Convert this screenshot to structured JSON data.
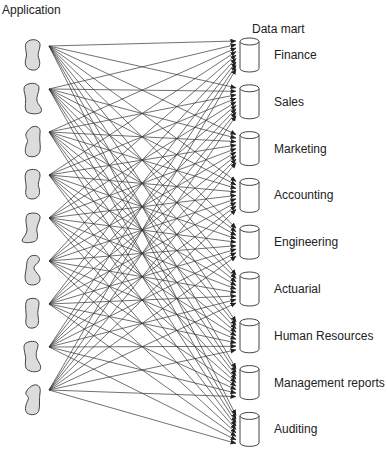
{
  "headings": {
    "applications": "Application",
    "data_marts": "Data mart"
  },
  "applications": [
    {
      "name": "Application 1"
    },
    {
      "name": "Application 2"
    },
    {
      "name": "Application 3"
    },
    {
      "name": "Application 4"
    },
    {
      "name": "Application 5"
    },
    {
      "name": "Application 6"
    },
    {
      "name": "Application 7"
    },
    {
      "name": "Application 8"
    },
    {
      "name": "Application 9"
    }
  ],
  "data_marts": [
    {
      "label": "Finance"
    },
    {
      "label": "Sales"
    },
    {
      "label": "Marketing"
    },
    {
      "label": "Accounting"
    },
    {
      "label": "Engineering"
    },
    {
      "label": "Actuarial"
    },
    {
      "label": "Human Resources"
    },
    {
      "label": "Management reports"
    },
    {
      "label": "Auditing"
    }
  ],
  "connections": "every application connects to every data mart (9 x 9 arrows)",
  "colors": {
    "blob_fill": "#dcdcdc",
    "stroke": "#444444",
    "line": "#333333"
  }
}
